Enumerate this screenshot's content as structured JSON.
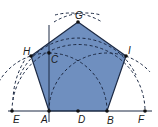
{
  "diagram": {
    "colors": {
      "fill": "#6f8fbf",
      "stroke": "#1d2a44",
      "dash": "#1d2a44",
      "background": "#ffffff"
    },
    "points": {
      "E": {
        "label": "E",
        "x": 12,
        "y": 111
      },
      "A": {
        "label": "A",
        "x": 49,
        "y": 111
      },
      "D": {
        "label": "D",
        "x": 78,
        "y": 111
      },
      "B": {
        "label": "B",
        "x": 107,
        "y": 111
      },
      "F": {
        "label": "F",
        "x": 145,
        "y": 111
      },
      "G": {
        "label": "G",
        "x": 78,
        "y": 22
      },
      "H": {
        "label": "H",
        "x": 31,
        "y": 56
      },
      "I": {
        "label": "I",
        "x": 126,
        "y": 56
      },
      "C": {
        "label": "C",
        "x": 49,
        "y": 53
      }
    },
    "pentagon": [
      "A",
      "B",
      "I",
      "G",
      "H"
    ]
  }
}
